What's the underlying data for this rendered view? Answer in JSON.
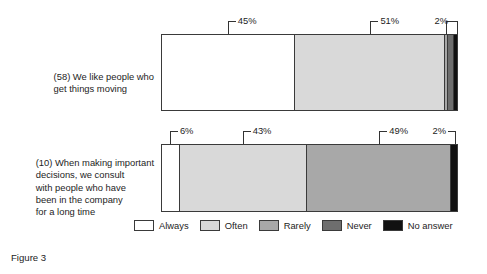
{
  "caption": "Figure 3",
  "legend": {
    "position": "bottom-center",
    "entries": [
      {
        "label": "Always",
        "color": "#ffffff"
      },
      {
        "label": "Often",
        "color": "#d9d9d9"
      },
      {
        "label": "Rarely",
        "color": "#a8a8a8"
      },
      {
        "label": "Never",
        "color": "#6e6e6e"
      },
      {
        "label": "No answer",
        "color": "#111111"
      }
    ]
  },
  "rows": [
    {
      "id": "item-58",
      "label": "(58) We like people who\nget things moving",
      "callouts": [
        {
          "text": "45%",
          "style": "elbow-left",
          "center_pct": 22.5
        },
        {
          "text": "51%",
          "style": "elbow-left",
          "center_pct": 70.5
        },
        {
          "text": "2%",
          "style": "bracket",
          "from_pct": 96.0,
          "to_pct": 100.0
        }
      ],
      "segments": [
        {
          "name": "Always",
          "value": 45,
          "color": "#ffffff"
        },
        {
          "name": "Often",
          "value": 51,
          "color": "#d9d9d9"
        },
        {
          "name": "Rarely",
          "value": 1,
          "color": "#a8a8a8"
        },
        {
          "name": "Never",
          "value": 2,
          "color": "#6e6e6e"
        },
        {
          "name": "No answer",
          "value": 1,
          "color": "#111111"
        }
      ]
    },
    {
      "id": "item-10",
      "label": "(10) When making important\ndecisions, we consult\nwith people who have\nbeen in the company\nfor a long time",
      "callouts": [
        {
          "text": "6%",
          "style": "elbow-left",
          "center_pct": 3.0
        },
        {
          "text": "43%",
          "style": "elbow-left",
          "center_pct": 27.5
        },
        {
          "text": "49%",
          "style": "elbow-left",
          "center_pct": 73.5
        },
        {
          "text": "2%",
          "style": "elbow-right",
          "center_pct": 99.0
        }
      ],
      "segments": [
        {
          "name": "Always",
          "value": 6,
          "color": "#ffffff"
        },
        {
          "name": "Often",
          "value": 43,
          "color": "#d9d9d9"
        },
        {
          "name": "Rarely",
          "value": 49,
          "color": "#a8a8a8"
        },
        {
          "name": "No answer",
          "value": 2,
          "color": "#111111"
        }
      ]
    }
  ],
  "chart_data": {
    "type": "bar",
    "subtype": "stacked-horizontal-100pct",
    "title": "Figure 3",
    "xlabel": "",
    "ylabel": "",
    "xlim": [
      0,
      100
    ],
    "grid": false,
    "legend_position": "bottom-center",
    "categories": [
      "(58) We like people who get things moving",
      "(10) When making important decisions, we consult with people who have been in the company for a long time"
    ],
    "series": [
      {
        "name": "Always",
        "color": "#ffffff",
        "values": [
          45,
          6
        ]
      },
      {
        "name": "Often",
        "color": "#d9d9d9",
        "values": [
          51,
          43
        ]
      },
      {
        "name": "Rarely",
        "color": "#a8a8a8",
        "values": [
          1,
          49
        ]
      },
      {
        "name": "Never",
        "color": "#6e6e6e",
        "values": [
          2,
          0
        ]
      },
      {
        "name": "No answer",
        "color": "#111111",
        "values": [
          1,
          2
        ]
      }
    ],
    "annotations": [
      {
        "category": 0,
        "text": "45%"
      },
      {
        "category": 0,
        "text": "51%"
      },
      {
        "category": 0,
        "text": "2%"
      },
      {
        "category": 1,
        "text": "6%"
      },
      {
        "category": 1,
        "text": "43%"
      },
      {
        "category": 1,
        "text": "49%"
      },
      {
        "category": 1,
        "text": "2%"
      }
    ]
  }
}
